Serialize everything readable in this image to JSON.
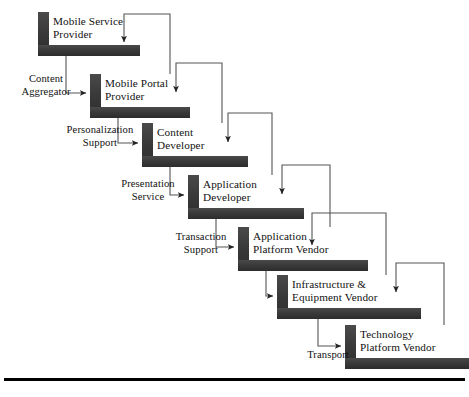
{
  "diagram": {
    "colors": {
      "bar_fill": "#3b3b3b",
      "bar_fill_dark": "#2e2e2e",
      "connector": "#555555",
      "text": "#111111",
      "rule": "#000000",
      "background": "#ffffff"
    },
    "stages": [
      {
        "id": "mobile-service-provider",
        "line1": "Mobile Service",
        "line2": "Provider",
        "bar": {
          "x": 38,
          "y": 12,
          "w": 102,
          "h": 44,
          "vw": 11,
          "hh": 11
        },
        "text": {
          "x": 53,
          "y": 15
        }
      },
      {
        "id": "mobile-portal-provider",
        "line1": "Mobile Portal",
        "line2": "Provider",
        "bar": {
          "x": 90,
          "y": 74,
          "w": 100,
          "h": 44,
          "vw": 11,
          "hh": 11
        },
        "text": {
          "x": 105,
          "y": 77
        }
      },
      {
        "id": "content-developer",
        "line1": "Content",
        "line2": "Developer",
        "bar": {
          "x": 142,
          "y": 123,
          "w": 106,
          "h": 44,
          "vw": 11,
          "hh": 11
        },
        "text": {
          "x": 157,
          "y": 126
        }
      },
      {
        "id": "application-developer",
        "line1": "Application",
        "line2": "Developer",
        "bar": {
          "x": 188,
          "y": 175,
          "w": 116,
          "h": 44,
          "vw": 11,
          "hh": 11
        },
        "text": {
          "x": 203,
          "y": 178
        }
      },
      {
        "id": "application-platform-vendor",
        "line1": "Application",
        "line2": "Platform Vendor",
        "bar": {
          "x": 238,
          "y": 227,
          "w": 130,
          "h": 44,
          "vw": 11,
          "hh": 11
        },
        "text": {
          "x": 253,
          "y": 230
        }
      },
      {
        "id": "infrastructure-equipment-vendor",
        "line1": "Infrastructure &",
        "line2": "Equipment Vendor",
        "bar": {
          "x": 277,
          "y": 275,
          "w": 144,
          "h": 44,
          "vw": 11,
          "hh": 11
        },
        "text": {
          "x": 292,
          "y": 278
        }
      },
      {
        "id": "technology-platform-vendor",
        "line1": "Technology",
        "line2": "Platform Vendor",
        "bar": {
          "x": 345,
          "y": 325,
          "w": 124,
          "h": 44,
          "vw": 11,
          "hh": 11
        },
        "text": {
          "x": 360,
          "y": 328
        }
      }
    ],
    "flows": [
      {
        "id": "content-aggregator",
        "line1": "Content",
        "line2": "Aggregator",
        "text": {
          "x": 8,
          "y": 72,
          "w": 76
        },
        "path": "M 66 56 L 66 93 L 86 93",
        "arrow": {
          "x": 86,
          "y": 93
        }
      },
      {
        "id": "personalization-support",
        "line1": "Personalization",
        "line2": "Support",
        "text": {
          "x": 48,
          "y": 123,
          "w": 104
        },
        "path": "M 118 118 L 118 143 L 138 143",
        "arrow": {
          "x": 138,
          "y": 143
        }
      },
      {
        "id": "presentation-service",
        "line1": "Presentation",
        "line2": "Service",
        "text": {
          "x": 100,
          "y": 177,
          "w": 96
        },
        "path": "M 170 167 L 170 195 L 184 195",
        "arrow": {
          "x": 184,
          "y": 195
        }
      },
      {
        "id": "transaction-support",
        "line1": "Transaction",
        "line2": "Support",
        "text": {
          "x": 155,
          "y": 230,
          "w": 92
        },
        "path": "M 216 219 L 216 247 L 234 247",
        "arrow": {
          "x": 234,
          "y": 247
        }
      },
      {
        "id": "equipment-link",
        "line1": "",
        "line2": "",
        "text": {
          "x": 0,
          "y": 0,
          "w": 0
        },
        "path": "M 266 271 L 266 296 L 273 296",
        "arrow": {
          "x": 273,
          "y": 296
        }
      },
      {
        "id": "transport",
        "line1": "Transport",
        "line2": "",
        "text": {
          "x": 292,
          "y": 348,
          "w": 72
        },
        "path": "M 318 319 L 318 346 L 341 346",
        "arrow": {
          "x": 341,
          "y": 346
        }
      }
    ],
    "feedback": [
      {
        "id": "feedback-portal-to-service",
        "path": "M 170 74 L 170 14 L 124 14 L 124 42",
        "arrow": {
          "x": 124,
          "y": 47
        }
      },
      {
        "id": "feedback-content-to-portal",
        "path": "M 222 123 L 222 63 L 176 63 L 176 92",
        "arrow": {
          "x": 176,
          "y": 97
        }
      },
      {
        "id": "feedback-appdev-to-content",
        "path": "M 272 175 L 272 113 L 228 113 L 228 142",
        "arrow": {
          "x": 228,
          "y": 147
        }
      },
      {
        "id": "feedback-platform-to-appdev",
        "path": "M 330 227 L 330 165 L 282 165 L 282 194",
        "arrow": {
          "x": 282,
          "y": 199
        }
      },
      {
        "id": "feedback-infra-to-platform",
        "path": "M 386 275 L 386 213 L 312 213 L 312 245",
        "arrow": {
          "x": 312,
          "y": 250
        }
      },
      {
        "id": "feedback-tech-to-infra",
        "path": "M 444 325 L 444 263 L 396 263 L 396 292",
        "arrow": {
          "x": 396,
          "y": 297
        }
      }
    ],
    "bottom_rule": {
      "x": 4,
      "y": 378,
      "w": 461,
      "h": 3
    }
  }
}
